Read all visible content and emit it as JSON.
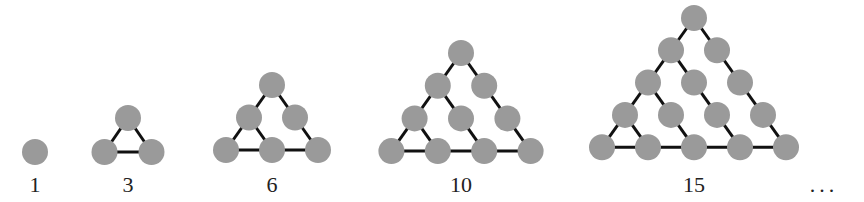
{
  "colors": {
    "dot": "#9a9a9a",
    "edge": "#111111",
    "text": "#222222"
  },
  "dot_radius": 13,
  "figures": [
    {
      "label": "1",
      "n": 1,
      "top": [
        35,
        152
      ],
      "dx": 23,
      "dy": 33
    },
    {
      "label": "3",
      "n": 2,
      "top": [
        128,
        118
      ],
      "dx": 23.5,
      "dy": 34
    },
    {
      "label": "6",
      "n": 3,
      "top": [
        272,
        85
      ],
      "dx": 23,
      "dy": 32.5
    },
    {
      "label": "10",
      "n": 4,
      "top": [
        461,
        53
      ],
      "dx": 23.2,
      "dy": 32.7
    },
    {
      "label": "15",
      "n": 5,
      "top": [
        694,
        18
      ],
      "dx": 23,
      "dy": 32.3
    }
  ],
  "ellipsis": "..."
}
